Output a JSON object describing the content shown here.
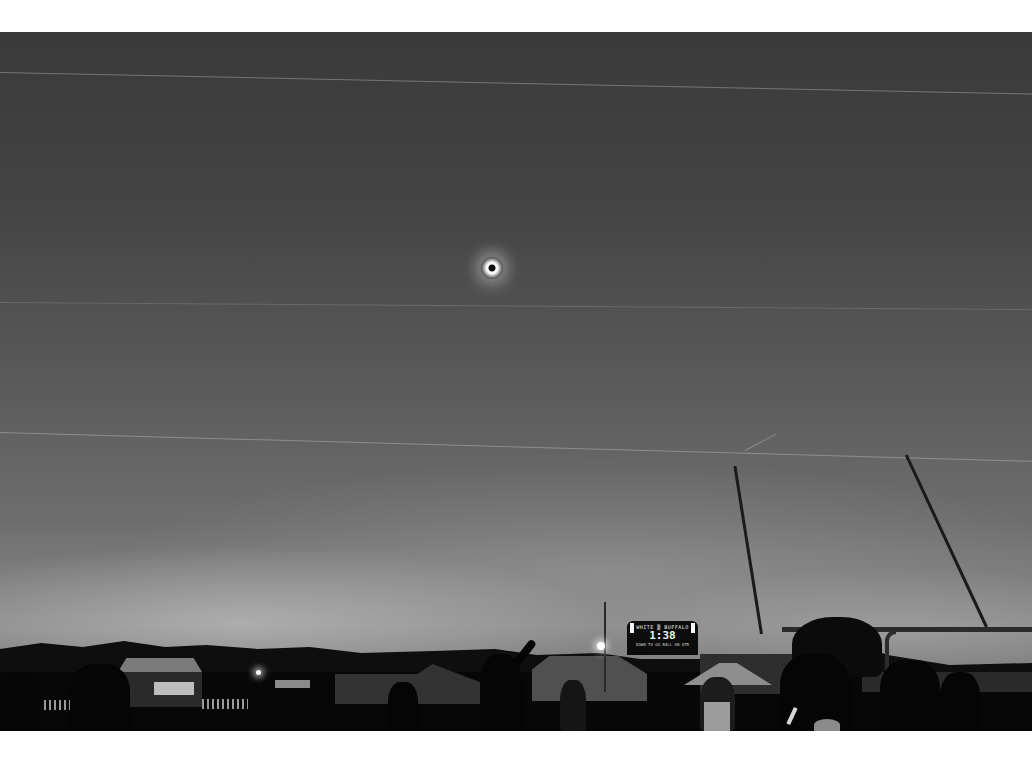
{
  "scene": {
    "subject": "Total solar eclipse over a high school football field",
    "palette": "black-and-white",
    "elements": {
      "sky": "overcast twilight sky with streaky clouds and faint contrails",
      "eclipse": "totality corona, small bright ring",
      "goalpost": "football goalpost uprights and crossbar on right side",
      "scoreboard": {
        "top_text": "WHITE ▒ BUFFALO",
        "clock": "1:38",
        "bottom_text": "DOWN  TO GO  BALL ON  QTR"
      },
      "crowd": "silhouetted spectators, one person pointing up at the eclipse",
      "background": "tents, buildings, treeline on horizon"
    }
  },
  "frame": {
    "border_color": "#ffffff",
    "sky_color_top": "#3a3a3a",
    "sky_color_horizon": "#8a8a8a",
    "ground_color": "#070707"
  }
}
